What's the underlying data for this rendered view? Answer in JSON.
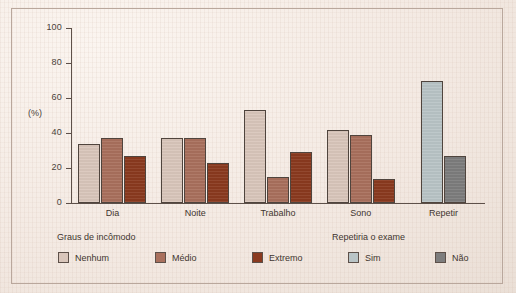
{
  "chart_data": {
    "type": "bar",
    "title": "",
    "subtitle": "",
    "xlabel": "",
    "ylabel": "(%)",
    "ylim": [
      0,
      100
    ],
    "yticks": [
      0,
      20,
      40,
      60,
      80,
      100
    ],
    "grid": false,
    "categories": [
      "Dia",
      "Noite",
      "Trabalho",
      "Sono",
      "Repetir"
    ],
    "series": [
      {
        "name": "Nenhum",
        "color": "#d9c6bb",
        "values": [
          34,
          37,
          53,
          42,
          null
        ]
      },
      {
        "name": "Médio",
        "color": "#a9705d",
        "values": [
          37,
          37,
          15,
          39,
          null
        ]
      },
      {
        "name": "Extremo",
        "color": "#8a3a1f",
        "values": [
          27,
          23,
          29,
          14,
          null
        ]
      },
      {
        "name": "Sim",
        "color": "#b9c4c6",
        "values": [
          null,
          null,
          null,
          null,
          70
        ]
      },
      {
        "name": "Não",
        "color": "#7d7d7d",
        "values": [
          null,
          null,
          null,
          null,
          27
        ]
      }
    ],
    "legends": [
      {
        "title": "Graus de incômodo",
        "entries": [
          {
            "label": "Nenhum",
            "color": "#d9c6bb"
          },
          {
            "label": "Médio",
            "color": "#a9705d"
          },
          {
            "label": "Extremo",
            "color": "#8a3a1f"
          }
        ]
      },
      {
        "title": "Repetiria o exame",
        "entries": [
          {
            "label": "Sim",
            "color": "#b9c4c6"
          },
          {
            "label": "Não",
            "color": "#7d7d7d"
          }
        ]
      }
    ]
  },
  "axis": {
    "y_title": "(%)",
    "tick_labels": [
      "100",
      "80",
      "60",
      "40",
      "20",
      "0"
    ]
  },
  "legend_left": {
    "title": "Graus de incômodo",
    "items": [
      "Nenhum",
      "Médio",
      "Extremo"
    ]
  },
  "legend_right": {
    "title": "Repetiria o exame",
    "items": [
      "Sim",
      "Não"
    ]
  },
  "colors": {
    "background": "#f4ece6",
    "frame": "#b9a79c",
    "axis": "#5d5049",
    "text": "#3f352f",
    "nenhum": "#d9c6bb",
    "medio": "#a9705d",
    "extremo": "#8a3a1f",
    "sim": "#b9c4c6",
    "nao": "#7d7d7d"
  }
}
